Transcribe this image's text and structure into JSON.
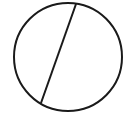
{
  "diagram": {
    "canvas": {
      "width": 124,
      "height": 123,
      "background": "#ffffff"
    },
    "stroke_color": "#1a1a1a",
    "stroke_width": 2,
    "circle": {
      "cx": 68,
      "cy": 57,
      "r": 54
    },
    "chord": {
      "x1": 76,
      "y1": 4,
      "x2": 41,
      "y2": 103
    }
  }
}
